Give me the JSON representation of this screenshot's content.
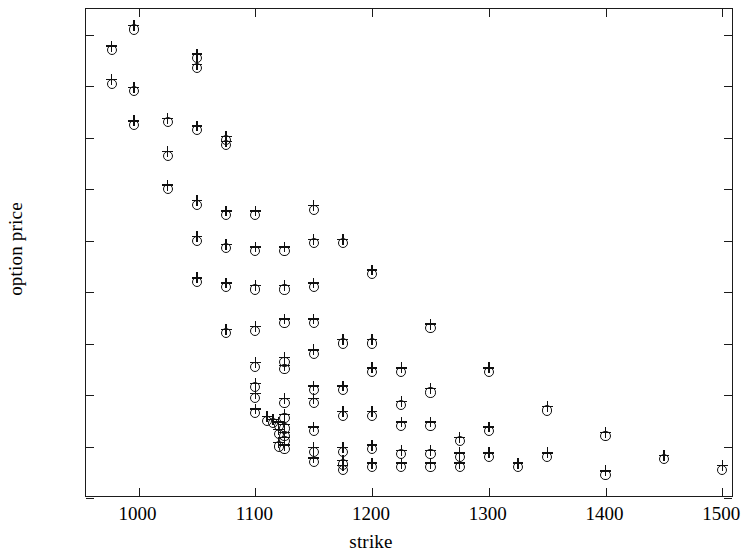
{
  "chart_data": {
    "type": "scatter",
    "title": "",
    "xlabel": "strike",
    "ylabel": "option price",
    "xlim": [
      955,
      1510
    ],
    "ylim": [
      0,
      190
    ],
    "xticks": [
      1000,
      1100,
      1200,
      1300,
      1400,
      1500
    ],
    "yticks": [
      0,
      20,
      40,
      60,
      80,
      100,
      120,
      140,
      160,
      180
    ],
    "grid": false,
    "legend": null,
    "marker_style": "circle-with-plus",
    "series": [
      {
        "name": "observed option prices",
        "marker": "o",
        "color": "#101010",
        "points": [
          [
            977,
            174
          ],
          [
            977,
            161
          ],
          [
            996,
            182
          ],
          [
            996,
            158
          ],
          [
            996,
            145
          ],
          [
            1025,
            146
          ],
          [
            1025,
            133
          ],
          [
            1025,
            120
          ],
          [
            1050,
            171
          ],
          [
            1050,
            167
          ],
          [
            1050,
            143
          ],
          [
            1050,
            114
          ],
          [
            1050,
            100
          ],
          [
            1050,
            84
          ],
          [
            1075,
            139
          ],
          [
            1075,
            137
          ],
          [
            1075,
            110
          ],
          [
            1075,
            97
          ],
          [
            1075,
            82
          ],
          [
            1075,
            64
          ],
          [
            1100,
            110
          ],
          [
            1100,
            96
          ],
          [
            1100,
            81
          ],
          [
            1100,
            65
          ],
          [
            1100,
            51
          ],
          [
            1100,
            43
          ],
          [
            1100,
            39
          ],
          [
            1100,
            33
          ],
          [
            1110,
            30
          ],
          [
            1115,
            29
          ],
          [
            1120,
            28
          ],
          [
            1120,
            25
          ],
          [
            1120,
            20
          ],
          [
            1125,
            96
          ],
          [
            1125,
            81
          ],
          [
            1125,
            68
          ],
          [
            1125,
            53
          ],
          [
            1125,
            50
          ],
          [
            1125,
            37
          ],
          [
            1125,
            31
          ],
          [
            1125,
            27
          ],
          [
            1125,
            24
          ],
          [
            1125,
            22
          ],
          [
            1125,
            19
          ],
          [
            1150,
            112
          ],
          [
            1150,
            99
          ],
          [
            1150,
            82
          ],
          [
            1150,
            68
          ],
          [
            1150,
            56
          ],
          [
            1150,
            42
          ],
          [
            1150,
            37
          ],
          [
            1150,
            26
          ],
          [
            1150,
            18
          ],
          [
            1150,
            14
          ],
          [
            1175,
            99
          ],
          [
            1175,
            60
          ],
          [
            1175,
            42
          ],
          [
            1175,
            32
          ],
          [
            1175,
            18
          ],
          [
            1175,
            13
          ],
          [
            1175,
            11
          ],
          [
            1200,
            87
          ],
          [
            1200,
            60
          ],
          [
            1200,
            49
          ],
          [
            1200,
            32
          ],
          [
            1200,
            19
          ],
          [
            1200,
            12
          ],
          [
            1225,
            49
          ],
          [
            1225,
            36
          ],
          [
            1225,
            28
          ],
          [
            1225,
            17
          ],
          [
            1225,
            12
          ],
          [
            1250,
            66
          ],
          [
            1250,
            41
          ],
          [
            1250,
            28
          ],
          [
            1250,
            17
          ],
          [
            1250,
            12
          ],
          [
            1275,
            22
          ],
          [
            1275,
            16
          ],
          [
            1275,
            12
          ],
          [
            1300,
            49
          ],
          [
            1300,
            26
          ],
          [
            1300,
            16
          ],
          [
            1325,
            12
          ],
          [
            1350,
            34
          ],
          [
            1350,
            16
          ],
          [
            1400,
            24
          ],
          [
            1400,
            9
          ],
          [
            1450,
            15
          ],
          [
            1500,
            11
          ]
        ]
      }
    ]
  },
  "axes": {
    "ylabel": "option price",
    "xlabel": "strike",
    "ytick_labels": [
      "0",
      "20",
      "40",
      "60",
      "80",
      "100",
      "120",
      "140",
      "160",
      "180"
    ],
    "xtick_labels": [
      "1000",
      "1100",
      "1200",
      "1300",
      "1400",
      "1500"
    ]
  }
}
